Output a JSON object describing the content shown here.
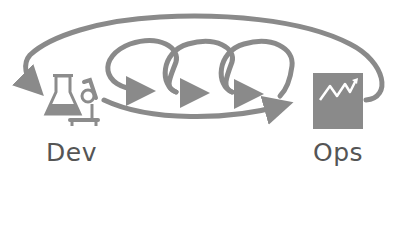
{
  "diagram": {
    "nodes": [
      {
        "id": "dev",
        "label": "Dev",
        "icon": "lab-flask-microscope-icon"
      },
      {
        "id": "ops",
        "label": "Ops",
        "icon": "monitoring-chart-icon"
      }
    ],
    "edges": [
      {
        "from": "dev",
        "to": "ops",
        "style": "curved-arrow"
      },
      {
        "from": "ops",
        "to": "dev",
        "style": "outer-loop-arrow"
      },
      {
        "from": "dev",
        "to": "dev",
        "style": "iteration-loop",
        "count": 3
      }
    ],
    "colors": {
      "stroke": "#8a8a8a",
      "icon_fill": "#8c8c8c",
      "ops_box": "#8a8a8a",
      "text": "#555555",
      "background": "#ffffff"
    }
  }
}
